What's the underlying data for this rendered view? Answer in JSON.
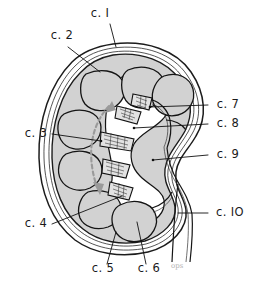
{
  "figure": {
    "type": "anatomical-line-diagram",
    "background_color": "#ffffff",
    "ink_color": "#1a1a1a",
    "cortex_fill": "#d2d2d2",
    "sinus_fill": "#ffffff",
    "arrow_color": "#9a9a9a",
    "signature": "ops"
  },
  "labels": [
    {
      "id": "c1",
      "text": "c. I",
      "x": 100,
      "y": 17,
      "anchor": "middle"
    },
    {
      "id": "c2",
      "text": "c. 2",
      "x": 62,
      "y": 39,
      "anchor": "middle"
    },
    {
      "id": "c3",
      "text": "c. 3",
      "x": 36,
      "y": 137,
      "anchor": "middle"
    },
    {
      "id": "c4",
      "text": "c. 4",
      "x": 36,
      "y": 227,
      "anchor": "middle"
    },
    {
      "id": "c5",
      "text": "c. 5",
      "x": 103,
      "y": 272,
      "anchor": "middle"
    },
    {
      "id": "c6",
      "text": "c. 6",
      "x": 149,
      "y": 272,
      "anchor": "middle"
    },
    {
      "id": "c7",
      "text": "c. 7",
      "x": 228,
      "y": 108,
      "anchor": "middle"
    },
    {
      "id": "c8",
      "text": "c. 8",
      "x": 228,
      "y": 127,
      "anchor": "middle"
    },
    {
      "id": "c9",
      "text": "c. 9",
      "x": 228,
      "y": 158,
      "anchor": "middle"
    },
    {
      "id": "c10",
      "text": "c. IO",
      "x": 230,
      "y": 216,
      "anchor": "middle"
    }
  ],
  "leader_lines": [
    {
      "id": "c1",
      "points": "110,24 116,47"
    },
    {
      "id": "c2",
      "points": "68,47 100,72"
    },
    {
      "id": "c3",
      "points": "52,134 101,141"
    },
    {
      "id": "c4",
      "points": "52,224 122,196"
    },
    {
      "id": "c5",
      "points": "107,264 116,232"
    },
    {
      "id": "c6",
      "points": "146,264 137,222"
    },
    {
      "id": "c7",
      "points": "208,105 150,107"
    },
    {
      "id": "c8",
      "points": "208,124 134,128"
    },
    {
      "id": "c9",
      "points": "208,155 153,160"
    },
    {
      "id": "c10",
      "points": "208,213 178,213"
    }
  ],
  "legend_note": {
    "numbering_style": "c. <n>",
    "count": 10
  }
}
